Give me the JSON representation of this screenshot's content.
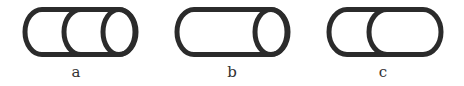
{
  "figure": {
    "stroke_color": "#2b2b2b",
    "background": "#ffffff",
    "panels": [
      {
        "label": "a",
        "description": "capsule with two internal ellipse arcs (three-segment cylinder)"
      },
      {
        "label": "b",
        "description": "capsule with a single full ellipse at right end (cylinder)"
      },
      {
        "label": "c",
        "description": "capsule with one internal arc (two rounded segments)"
      }
    ]
  }
}
